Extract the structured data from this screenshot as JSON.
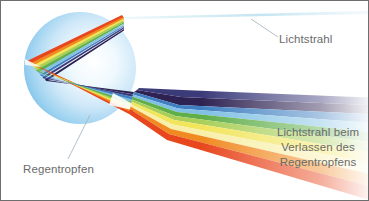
{
  "figure": {
    "background_color": "#ffffff",
    "border_color": "#6e6e6e",
    "width": 369,
    "height": 201
  },
  "labels": {
    "incoming_ray": "Lichtstrahl",
    "raindrop": "Regentropfen",
    "exit_ray_line1": "Lichtstrahl beim",
    "exit_ray_line2": "Verlassen des",
    "exit_ray_line3": "Regentropfens",
    "text_color": "#6b6b6b"
  },
  "diagram": {
    "raindrop": {
      "name": "raindrop-sphere",
      "center_x": 79,
      "center_y": 67,
      "radius": 56,
      "fill_light": "#f2fafe",
      "fill_mid": "#bfe0f5",
      "fill_edge": "#6fb8e6"
    },
    "incoming_ray": {
      "name": "incoming-white-ray",
      "color": "#d8eef6",
      "entry_x": 120,
      "entry_y": 16
    },
    "leader_lines": {
      "color": "#a9b8c2",
      "incoming_from_x": 250,
      "incoming_from_y": 18,
      "incoming_to_x": 277,
      "incoming_to_y": 36,
      "raindrop_from_x": 89,
      "raindrop_from_y": 114,
      "raindrop_to_x": 67,
      "raindrop_to_y": 158
    },
    "spectrum_bands": [
      {
        "name": "violet",
        "color": "#2e2252"
      },
      {
        "name": "indigo",
        "color": "#3c3b7a"
      },
      {
        "name": "blue",
        "color": "#3f7fc1"
      },
      {
        "name": "light-blue",
        "color": "#7fc0e4"
      },
      {
        "name": "green",
        "color": "#5fae4a"
      },
      {
        "name": "light-green",
        "color": "#a9cf5a"
      },
      {
        "name": "yellow",
        "color": "#f2e55c"
      },
      {
        "name": "light-yellow",
        "color": "#f8efa8"
      },
      {
        "name": "orange",
        "color": "#f08a21"
      },
      {
        "name": "red-orange",
        "color": "#e8471e"
      }
    ]
  }
}
